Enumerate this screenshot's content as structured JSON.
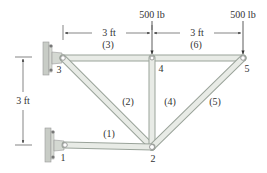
{
  "diagram": {
    "type": "truss",
    "nodes": [
      {
        "id": "1",
        "label": "1",
        "x": 65,
        "y": 145
      },
      {
        "id": "2",
        "label": "2",
        "x": 152,
        "y": 147
      },
      {
        "id": "3",
        "label": "3",
        "x": 63,
        "y": 58
      },
      {
        "id": "4",
        "label": "4",
        "x": 152,
        "y": 58
      },
      {
        "id": "5",
        "label": "5",
        "x": 243,
        "y": 58
      }
    ],
    "members": [
      {
        "id": "1",
        "label": "(1)",
        "from": "1",
        "to": "2"
      },
      {
        "id": "2",
        "label": "(2)",
        "from": "3",
        "to": "2"
      },
      {
        "id": "3",
        "label": "(3)",
        "from": "3",
        "to": "4"
      },
      {
        "id": "4",
        "label": "(4)",
        "from": "4",
        "to": "2"
      },
      {
        "id": "5",
        "label": "(5)",
        "from": "2",
        "to": "5"
      },
      {
        "id": "6",
        "label": "(6)",
        "from": "4",
        "to": "5"
      }
    ],
    "supports": [
      {
        "node": "3",
        "type": "wall-pin"
      },
      {
        "node": "1",
        "type": "wall-pin"
      }
    ],
    "loads": [
      {
        "node": "4",
        "label": "500 lb",
        "direction": "down"
      },
      {
        "node": "5",
        "label": "500 lb",
        "direction": "down"
      }
    ],
    "dimensions": [
      {
        "label": "3 ft",
        "from": "3",
        "to": "4",
        "orientation": "horizontal"
      },
      {
        "label": "3 ft",
        "from": "4",
        "to": "5",
        "orientation": "horizontal"
      },
      {
        "label": "3 ft",
        "from": "3",
        "to": "1",
        "orientation": "vertical"
      }
    ]
  },
  "text": {
    "load_4": "500 lb",
    "load_5": "500 lb",
    "dim_34": "3 ft",
    "dim_45": "3 ft",
    "dim_vert": "3 ft",
    "m1": "(1)",
    "m2": "(2)",
    "m3": "(3)",
    "m4": "(4)",
    "m5": "(5)",
    "m6": "(6)",
    "n1": "1",
    "n2": "2",
    "n3": "3",
    "n4": "4",
    "n5": "5"
  },
  "colors": {
    "member_fill": "#e8ebe6",
    "member_stroke": "#9aa39a",
    "wall": "#c8ccc6",
    "text": "#333333"
  }
}
